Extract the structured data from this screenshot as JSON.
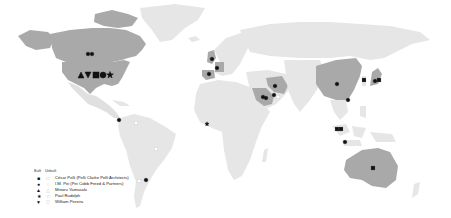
{
  "map": {
    "background": "#ffffff",
    "colors": {
      "land_default": "#e6e6e6",
      "land_highlight": "#a9a9a9",
      "land_highlight_dark": "#9a9a9a",
      "marker_built": "#111111",
      "marker_unbuilt": "#cfcfcf"
    },
    "highlighted_regions": [
      "Canada",
      "United States",
      "United Kingdom",
      "Germany",
      "Spain",
      "Iran",
      "Saudi Arabia",
      "China",
      "Japan",
      "Australia"
    ]
  },
  "legend": {
    "header_built": "Built",
    "header_unbuilt": "Unbuilt",
    "items": [
      {
        "architect": "César Pelli (Pelli Clarke Pelli Architects)",
        "symbol": "square",
        "built_glyph": "■",
        "unbuilt_glyph": "□"
      },
      {
        "architect": "I.M. Pei (Pei Cobb Freed & Partners)",
        "symbol": "circle",
        "built_glyph": "●",
        "unbuilt_glyph": "○"
      },
      {
        "architect": "Minoru Yamasaki",
        "symbol": "triangle-up",
        "built_glyph": "▲",
        "unbuilt_glyph": "△"
      },
      {
        "architect": "Paul Rudolph",
        "symbol": "star",
        "built_glyph": "★",
        "unbuilt_glyph": "☆"
      },
      {
        "architect": "William Pereira",
        "symbol": "triangle-down",
        "built_glyph": "▼",
        "unbuilt_glyph": "▽"
      }
    ]
  },
  "markers": [
    {
      "x": 88,
      "y": 54,
      "symbol": "circle",
      "status": "built"
    },
    {
      "x": 92,
      "y": 54,
      "symbol": "circle",
      "status": "built"
    },
    {
      "x": 81,
      "y": 75,
      "symbol": "triangle-up",
      "status": "built",
      "size": "large"
    },
    {
      "x": 88,
      "y": 75,
      "symbol": "triangle-down",
      "status": "built",
      "size": "large"
    },
    {
      "x": 96,
      "y": 75,
      "symbol": "square",
      "status": "built",
      "size": "large"
    },
    {
      "x": 103,
      "y": 75,
      "symbol": "circle",
      "status": "built",
      "size": "large"
    },
    {
      "x": 110,
      "y": 75,
      "symbol": "star",
      "status": "built",
      "size": "large"
    },
    {
      "x": 119,
      "y": 120,
      "symbol": "circle",
      "status": "built"
    },
    {
      "x": 136,
      "y": 123,
      "symbol": "square",
      "status": "unbuilt"
    },
    {
      "x": 156,
      "y": 149,
      "symbol": "square",
      "status": "unbuilt"
    },
    {
      "x": 146,
      "y": 180,
      "symbol": "circle",
      "status": "built"
    },
    {
      "x": 139,
      "y": 181,
      "symbol": "square",
      "status": "unbuilt"
    },
    {
      "x": 212,
      "y": 59,
      "symbol": "circle",
      "status": "built"
    },
    {
      "x": 217,
      "y": 68,
      "symbol": "circle",
      "status": "built"
    },
    {
      "x": 209,
      "y": 74,
      "symbol": "circle",
      "status": "built"
    },
    {
      "x": 207,
      "y": 124,
      "symbol": "star",
      "status": "built"
    },
    {
      "x": 275,
      "y": 86,
      "symbol": "circle",
      "status": "built"
    },
    {
      "x": 263,
      "y": 97,
      "symbol": "circle",
      "status": "built"
    },
    {
      "x": 266,
      "y": 98,
      "symbol": "circle",
      "status": "built"
    },
    {
      "x": 274,
      "y": 95,
      "symbol": "circle",
      "status": "built"
    },
    {
      "x": 278,
      "y": 97,
      "symbol": "square",
      "status": "unbuilt"
    },
    {
      "x": 337,
      "y": 84,
      "symbol": "circle",
      "status": "built"
    },
    {
      "x": 364,
      "y": 80,
      "symbol": "square",
      "status": "built"
    },
    {
      "x": 375,
      "y": 81,
      "symbol": "circle",
      "status": "built"
    },
    {
      "x": 379,
      "y": 80,
      "symbol": "square",
      "status": "built"
    },
    {
      "x": 348,
      "y": 100,
      "symbol": "circle",
      "status": "built"
    },
    {
      "x": 337,
      "y": 129,
      "symbol": "square",
      "status": "built"
    },
    {
      "x": 341,
      "y": 129,
      "symbol": "square",
      "status": "built"
    },
    {
      "x": 345,
      "y": 142,
      "symbol": "circle",
      "status": "built"
    },
    {
      "x": 373,
      "y": 168,
      "symbol": "square",
      "status": "built"
    }
  ]
}
